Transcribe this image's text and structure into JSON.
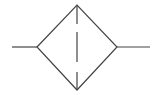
{
  "diagram": {
    "type": "schematic-symbol",
    "symbol": "filter",
    "stroke_color": "#444444",
    "background_color": "#ffffff",
    "elements": {
      "inlet_line": {
        "x1": 12,
        "y1": 47,
        "x2": 37,
        "y2": 47
      },
      "diamond": {
        "left": [
          37,
          47
        ],
        "top": [
          77,
          5
        ],
        "right": [
          117,
          47
        ],
        "bottom": [
          77,
          90
        ]
      },
      "outlet_line": {
        "x1": 117,
        "y1": 47,
        "x2": 150,
        "y2": 47
      },
      "filter_element_dashes": [
        {
          "x": 77,
          "y1": 5,
          "y2": 24
        },
        {
          "x": 77,
          "y1": 32,
          "y2": 62
        },
        {
          "x": 77,
          "y1": 72,
          "y2": 90
        }
      ]
    }
  }
}
